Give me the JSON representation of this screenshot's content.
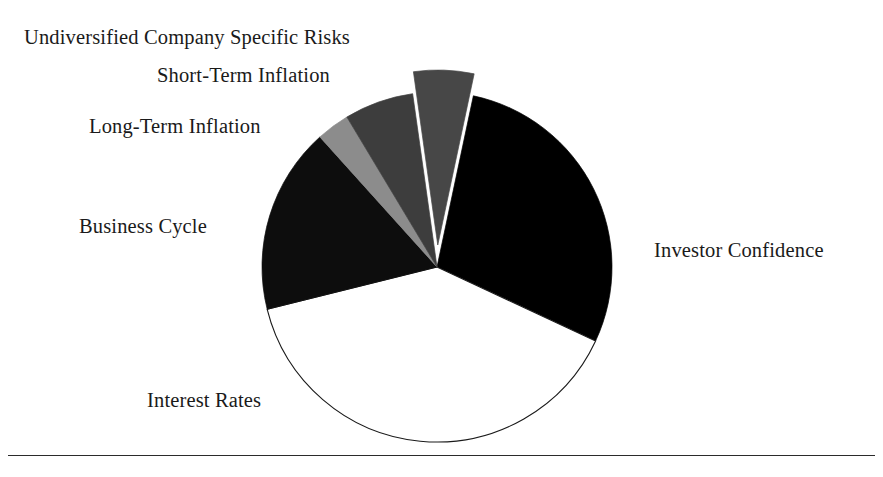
{
  "figure": {
    "title": "",
    "background_color": "#ffffff",
    "text_color": "#1a1a1a",
    "rule_color": "#2b2b2b",
    "center_x": 437,
    "center_y": 267,
    "radius": 175
  },
  "labels": {
    "undiversified": "Undiversified Company Specific Risks",
    "short_term": "Short-Term Inflation",
    "long_term": "Long-Term Inflation",
    "business_cycle": "Business Cycle",
    "investor_confidence": "Investor Confidence",
    "interest_rates": "Interest Rates"
  },
  "chart_data": {
    "type": "pie",
    "title": "",
    "subtitle": "",
    "xlabel": "",
    "ylabel": "",
    "grid": false,
    "legend_position": "none",
    "label_placement": "outside-leaderless",
    "start_angle_deg_from_12oclock": 12,
    "direction": "clockwise",
    "total_degrees": 360,
    "slices": [
      {
        "label": "Investor Confidence",
        "value": 28.6,
        "degrees": 103,
        "start_deg": 12,
        "end_deg": 115,
        "fill": "#000000",
        "stroke": "#000000",
        "exploded": false,
        "label_x": 654,
        "label_y": 239
      },
      {
        "label": "Interest Rates",
        "value": 39.2,
        "degrees": 141,
        "start_deg": 115,
        "end_deg": 256,
        "fill": "#ffffff",
        "stroke": "#1a1a1a",
        "exploded": false,
        "label_x": 147,
        "label_y": 389
      },
      {
        "label": "Business Cycle",
        "value": 17.2,
        "degrees": 62,
        "start_deg": 256,
        "end_deg": 318,
        "fill": "#0d0d0d",
        "stroke": "#0d0d0d",
        "exploded": false,
        "label_x": 79,
        "label_y": 215
      },
      {
        "label": "Long-Term Inflation",
        "value": 3.1,
        "degrees": 11,
        "start_deg": 318,
        "end_deg": 329,
        "fill": "#8c8c8c",
        "stroke": "#8c8c8c",
        "exploded": false,
        "label_x": 89,
        "label_y": 115
      },
      {
        "label": "Short-Term Inflation",
        "value": 6.4,
        "degrees": 23,
        "start_deg": 329,
        "end_deg": 352,
        "fill": "#3d3d3d",
        "stroke": "#3d3d3d",
        "exploded": false,
        "label_x": 157,
        "label_y": 64
      },
      {
        "label": "Undiversified Company Specific Risks",
        "value": 5.6,
        "degrees": 20,
        "start_deg": 352,
        "end_deg": 372,
        "fill": "#474747",
        "stroke": "#474747",
        "exploded": true,
        "explode_offset_px": 22,
        "label_x": 24,
        "label_y": 26
      }
    ]
  }
}
